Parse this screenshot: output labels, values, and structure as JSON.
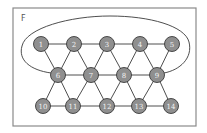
{
  "diagram": {
    "face_label": "F",
    "frame": {
      "x": 13,
      "y": 8,
      "width": 183,
      "height": 118,
      "stroke": "#8a8a8a"
    },
    "node_fill": "#8f8f8f",
    "node_stroke": "#3a3a3a",
    "node_text_color": "#f2f2f2",
    "node_radius": 7.5,
    "nodes": [
      {
        "id": "1",
        "label": "1",
        "x": 41,
        "y": 44
      },
      {
        "id": "2",
        "label": "2",
        "x": 74,
        "y": 44
      },
      {
        "id": "3",
        "label": "3",
        "x": 107,
        "y": 44
      },
      {
        "id": "4",
        "label": "4",
        "x": 140,
        "y": 44
      },
      {
        "id": "5",
        "label": "5",
        "x": 172,
        "y": 44
      },
      {
        "id": "6",
        "label": "6",
        "x": 58,
        "y": 75
      },
      {
        "id": "7",
        "label": "7",
        "x": 91,
        "y": 75
      },
      {
        "id": "8",
        "label": "8",
        "x": 124,
        "y": 75
      },
      {
        "id": "9",
        "label": "9",
        "x": 157,
        "y": 75
      },
      {
        "id": "10",
        "label": "10",
        "x": 43,
        "y": 106
      },
      {
        "id": "11",
        "label": "11",
        "x": 73,
        "y": 106
      },
      {
        "id": "12",
        "label": "12",
        "x": 107,
        "y": 106
      },
      {
        "id": "13",
        "label": "13",
        "x": 139,
        "y": 106
      },
      {
        "id": "14",
        "label": "14",
        "x": 171,
        "y": 106
      }
    ],
    "edges": [
      [
        "1",
        "2"
      ],
      [
        "2",
        "3"
      ],
      [
        "3",
        "4"
      ],
      [
        "4",
        "5"
      ],
      [
        "6",
        "7"
      ],
      [
        "7",
        "8"
      ],
      [
        "8",
        "9"
      ],
      [
        "10",
        "11"
      ],
      [
        "11",
        "12"
      ],
      [
        "12",
        "13"
      ],
      [
        "13",
        "14"
      ],
      [
        "1",
        "6"
      ],
      [
        "2",
        "6"
      ],
      [
        "2",
        "7"
      ],
      [
        "3",
        "7"
      ],
      [
        "3",
        "8"
      ],
      [
        "4",
        "8"
      ],
      [
        "4",
        "9"
      ],
      [
        "5",
        "9"
      ],
      [
        "6",
        "10"
      ],
      [
        "6",
        "11"
      ],
      [
        "7",
        "11"
      ],
      [
        "7",
        "12"
      ],
      [
        "8",
        "12"
      ],
      [
        "8",
        "13"
      ],
      [
        "9",
        "13"
      ],
      [
        "9",
        "14"
      ]
    ],
    "outer_edge": {
      "from": "6",
      "to": "9",
      "description": "curved edge looping around top of graph"
    }
  }
}
